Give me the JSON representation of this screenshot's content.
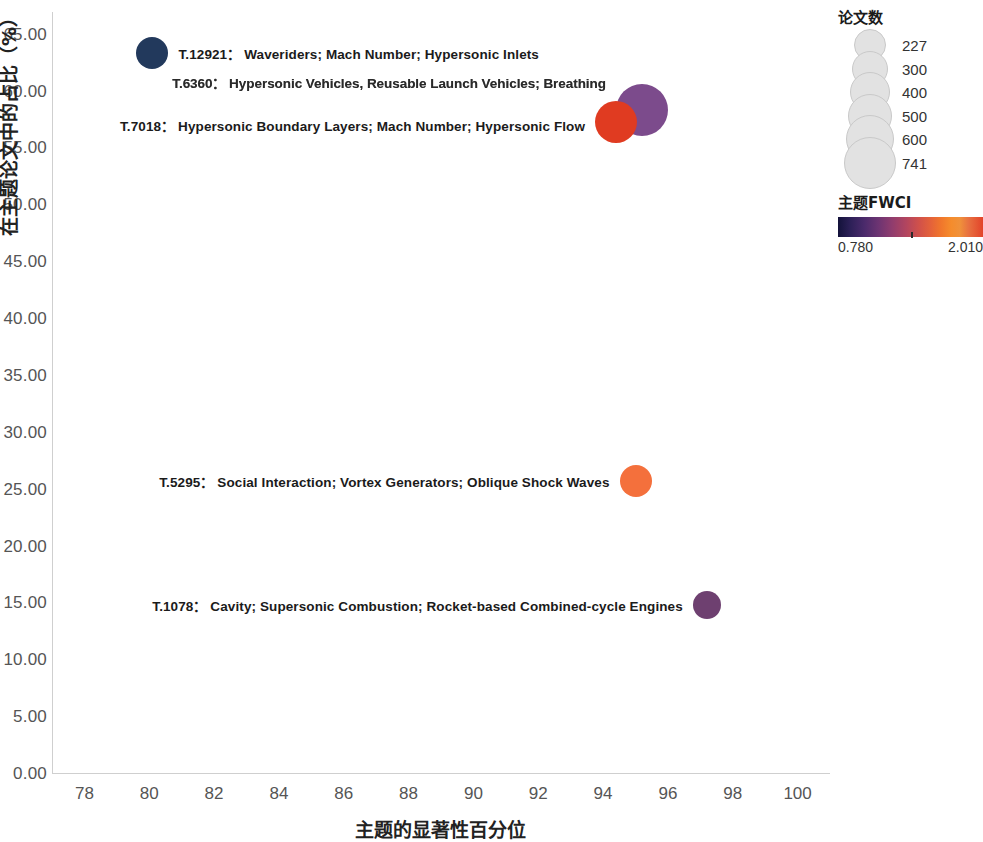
{
  "chart_data": {
    "type": "scatter",
    "title": "",
    "xlabel": "主题的显著性百分位",
    "ylabel": "在主题论文中的占比（%）",
    "xlim": [
      77,
      101
    ],
    "ylim": [
      0,
      67
    ],
    "xticks": [
      "78",
      "80",
      "82",
      "84",
      "86",
      "88",
      "90",
      "92",
      "94",
      "96",
      "98",
      "100"
    ],
    "yticks": [
      "0.00",
      "5.00",
      "10.00",
      "15.00",
      "20.00",
      "25.00",
      "30.00",
      "35.00",
      "40.00",
      "45.00",
      "50.00",
      "55.00",
      "60.00",
      "65.00"
    ],
    "grid": false,
    "legend_position": "right",
    "points": [
      {
        "id": "T.12921",
        "label": "T.12921：  Waveriders; Mach Number; Hypersonic Inlets",
        "x": 80.1,
        "y": 63.4,
        "papers": 227,
        "fwci": 0.78,
        "color": "#22395c",
        "radius": 16,
        "label_side": "right",
        "blurred": false
      },
      {
        "id": "T.6360",
        "label": "T.6360：  Hypersonic Vehicles, Reusable Launch Vehicles; Breathing",
        "x": 95.2,
        "y": 58.4,
        "papers": 600,
        "fwci": 1.25,
        "color": "#7c4b8c",
        "radius": 26,
        "label_side": "left",
        "blurred": true
      },
      {
        "id": "T.7018",
        "label": "T.7018：  Hypersonic Boundary Layers; Mach Number; Hypersonic Flow",
        "x": 94.4,
        "y": 57.3,
        "papers": 500,
        "fwci": 1.95,
        "color": "#e03b21",
        "radius": 21,
        "label_side": "left",
        "blurred": false
      },
      {
        "id": "T.5295",
        "label": "T.5295：  Social Interaction; Vortex Generators; Oblique Shock Waves",
        "x": 95.0,
        "y": 25.8,
        "papers": 400,
        "fwci": 1.8,
        "color": "#f4703c",
        "radius": 16,
        "label_side": "left",
        "blurred": false
      },
      {
        "id": "T.1078",
        "label": "T.1078：  Cavity; Supersonic Combustion; Rocket-based Combined-cycle Engines",
        "x": 97.2,
        "y": 14.9,
        "papers": 300,
        "fwci": 1.18,
        "color": "#6e4070",
        "radius": 14,
        "label_side": "left",
        "blurred": false
      }
    ],
    "size_legend": {
      "title": "论文数",
      "entries": [
        {
          "value": "227",
          "radius": 15
        },
        {
          "value": "300",
          "radius": 17
        },
        {
          "value": "400",
          "radius": 19
        },
        {
          "value": "500",
          "radius": 21
        },
        {
          "value": "600",
          "radius": 23
        },
        {
          "value": "741",
          "radius": 25
        }
      ]
    },
    "color_legend": {
      "title": "主题FWCI",
      "min": "0.780",
      "max": "2.010"
    }
  }
}
